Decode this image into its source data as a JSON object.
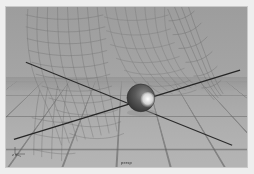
{
  "app": {
    "title": "3D Viewport",
    "background_color": "#eeeeee"
  },
  "viewport": {
    "name": "perspective-viewport",
    "background_color": "#9a9a9a",
    "ground_color": "#b4b4b4",
    "grid_line_color": "#5a5a5a",
    "axis_color": "#2b2b2b",
    "wireframe_color": "#6e6e6e",
    "sphere_color": "#4a4a4a",
    "sphere_highlight_color": "#f2f2f2",
    "border_color": "#c9c9c9"
  },
  "overlays": {
    "axis_gizmo_label": "z  x",
    "status_label": "persp"
  },
  "scene": {
    "objects": [
      {
        "name": "ground-grid",
        "type": "grid-plane",
        "label": "Grid"
      },
      {
        "name": "axis-lines",
        "type": "axes",
        "label": "Axes"
      },
      {
        "name": "sphere-object",
        "type": "sphere",
        "label": "Sphere"
      },
      {
        "name": "wireframe-surface-left",
        "type": "wireframe-tube",
        "label": "Tube 01"
      },
      {
        "name": "wireframe-surface-center",
        "type": "wireframe-tube",
        "label": "Tube 02"
      },
      {
        "name": "wireframe-surface-right",
        "type": "wireframe-arc",
        "label": "Arc 01"
      }
    ]
  }
}
